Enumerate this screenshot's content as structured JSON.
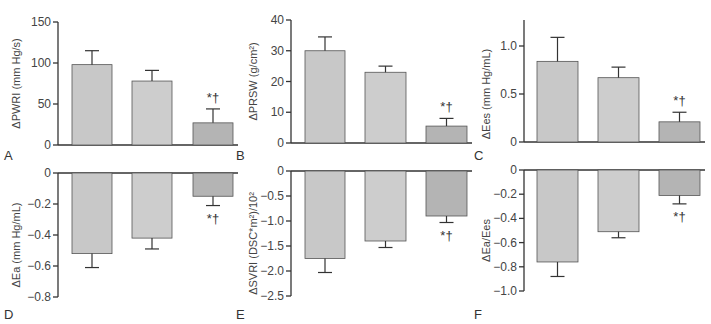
{
  "colors": {
    "bar_group1": "#c8c8c8",
    "bar_group2": "#cdcdcd",
    "bar_group3": "#b4b4b4",
    "axis": "#333333"
  },
  "significance_marker": "*†",
  "chart_data": [
    {
      "panel": "A",
      "type": "bar",
      "ylabel": "ΔPWRI (mm Hg/s)",
      "ylim": [
        0,
        150
      ],
      "yticks": [
        0,
        50,
        100,
        150
      ],
      "categories": [
        "Group 1",
        "Group 2",
        "Group 3"
      ],
      "values": [
        98,
        78,
        27
      ],
      "errors": [
        17,
        13,
        17
      ],
      "significance": [
        null,
        null,
        "*†"
      ]
    },
    {
      "panel": "B",
      "type": "bar",
      "ylabel": "ΔPRSW (g/cm²)",
      "ylim": [
        0,
        40
      ],
      "yticks": [
        0,
        10,
        20,
        30,
        40
      ],
      "categories": [
        "Group 1",
        "Group 2",
        "Group 3"
      ],
      "values": [
        30,
        23,
        5.5
      ],
      "errors": [
        4.5,
        2,
        2.5
      ],
      "significance": [
        null,
        null,
        "*†"
      ]
    },
    {
      "panel": "C",
      "type": "bar",
      "ylabel": "ΔEes (mm Hg/mL)",
      "ylim": [
        0,
        1.25
      ],
      "yticks": [
        0,
        0.5,
        1.0
      ],
      "categories": [
        "Group 1",
        "Group 2",
        "Group 3"
      ],
      "values": [
        0.84,
        0.67,
        0.21
      ],
      "errors": [
        0.25,
        0.11,
        0.1
      ],
      "significance": [
        null,
        null,
        "*†"
      ]
    },
    {
      "panel": "D",
      "type": "bar",
      "ylabel": "ΔEa (mm Hg/mL)",
      "ylim": [
        -0.8,
        0
      ],
      "yticks": [
        0,
        -0.2,
        -0.4,
        -0.6,
        -0.8
      ],
      "categories": [
        "Group 1",
        "Group 2",
        "Group 3"
      ],
      "values": [
        -0.52,
        -0.42,
        -0.15
      ],
      "errors": [
        0.09,
        0.07,
        0.06
      ],
      "significance": [
        null,
        null,
        "*†"
      ]
    },
    {
      "panel": "E",
      "type": "bar",
      "ylabel": "ΔSVRI (DSC*m²)/10²",
      "ylim": [
        -2.5,
        0
      ],
      "yticks": [
        0,
        -0.5,
        -1.0,
        -1.5,
        -2.0,
        -2.5
      ],
      "categories": [
        "Group 1",
        "Group 2",
        "Group 3"
      ],
      "values": [
        -1.75,
        -1.4,
        -0.9
      ],
      "errors": [
        0.28,
        0.13,
        0.13
      ],
      "significance": [
        null,
        null,
        "*†"
      ]
    },
    {
      "panel": "F",
      "type": "bar",
      "ylabel": "ΔEa/Ees",
      "ylim": [
        -1.0,
        0
      ],
      "yticks": [
        0,
        -0.2,
        -0.4,
        -0.6,
        -0.8,
        -1.0
      ],
      "categories": [
        "Group 1",
        "Group 2",
        "Group 3"
      ],
      "values": [
        -0.76,
        -0.51,
        -0.21
      ],
      "errors": [
        0.12,
        0.05,
        0.07
      ],
      "significance": [
        null,
        null,
        "*†"
      ]
    }
  ],
  "tick_format": {
    "A": [
      "0",
      "50",
      "100",
      "150"
    ],
    "B": [
      "0",
      "10",
      "20",
      "30",
      "40"
    ],
    "C": [
      "0",
      "0.5",
      "1.0"
    ],
    "D": [
      "0",
      "−0.2",
      "−0.4",
      "−0.6",
      "−0.8"
    ],
    "E": [
      "0",
      "−0.5",
      "−1.0",
      "−1.5",
      "−2.0",
      "−2.5"
    ],
    "F": [
      "0",
      "−0.2",
      "−0.4",
      "−0.6",
      "−0.8",
      "−1.0"
    ]
  }
}
